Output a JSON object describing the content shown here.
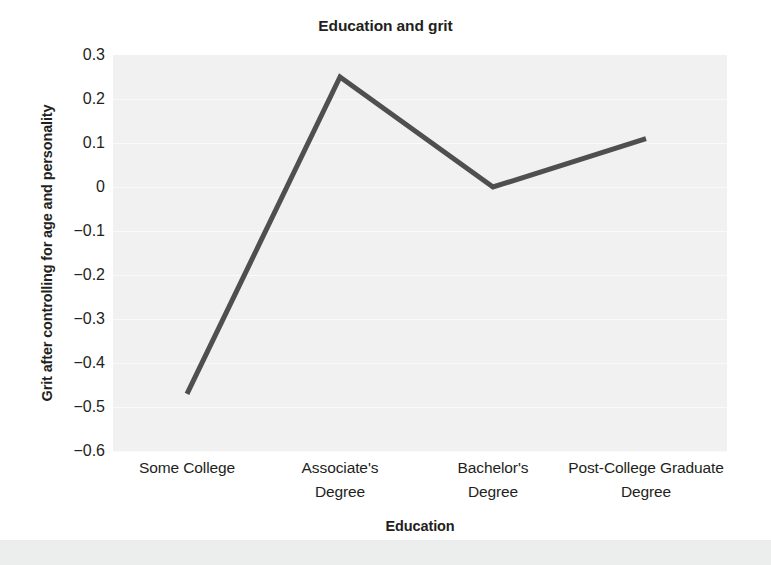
{
  "chart_data": {
    "type": "line",
    "title": "Education and grit",
    "xlabel": "Education",
    "ylabel": "Grit after controlling for age and personality",
    "categories": [
      "Some College",
      "Associate's\nDegree",
      "Bachelor's\nDegree",
      "Post-College Graduate\nDegree"
    ],
    "category_lines": [
      [
        "Some College",
        ""
      ],
      [
        "Associate's",
        "Degree"
      ],
      [
        "Bachelor's",
        "Degree"
      ],
      [
        "Post-College Graduate",
        "Degree"
      ]
    ],
    "values": [
      -0.47,
      0.25,
      0.0,
      0.11
    ],
    "ylim": [
      -0.6,
      0.3
    ],
    "ytick_labels": [
      "0.3",
      "0.2",
      "0.1",
      "0",
      "−0.1",
      "−0.2",
      "−0.3",
      "−0.4",
      "−0.5",
      "−0.6"
    ],
    "ytick_values": [
      0.3,
      0.2,
      0.1,
      0,
      -0.1,
      -0.2,
      -0.3,
      -0.4,
      -0.5,
      -0.6
    ],
    "grid": true,
    "legend": "none",
    "series_color": "#4f4f4f",
    "plot_background": "#f1f1f1",
    "gridline_color": "#fafafa",
    "text_color": "#231f20"
  }
}
